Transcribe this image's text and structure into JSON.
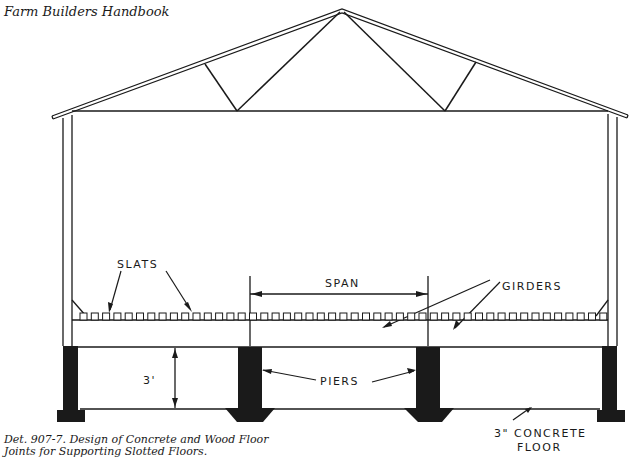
{
  "header": {
    "title": "Farm Builders Handbook"
  },
  "drawing": {
    "labels": {
      "slats": "SLATS",
      "span": "SPAN",
      "girders": "GIRDERS",
      "height": "3'",
      "piers": "PIERS",
      "floor_line1": "3\" CONCRETE",
      "floor_line2": "FLOOR"
    },
    "colors": {
      "ink": "#1a1a1a",
      "paper": "#ffffff"
    }
  },
  "caption": {
    "line1": "Det. 907-7.  Design of Concrete and Wood Floor",
    "line2": "Joints for Supporting Slotted Floors."
  }
}
